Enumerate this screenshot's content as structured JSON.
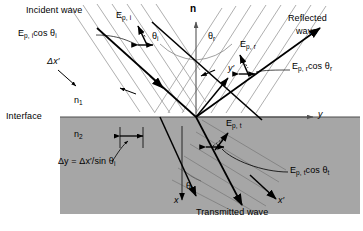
{
  "figure": {
    "colors": {
      "background": "#ffffff",
      "medium2_fill": "#a6a6a6",
      "ray": "#000000",
      "wavefront": "#8c8c8c",
      "axis": "#595959"
    }
  },
  "labels": {
    "incident_wave": "Incident wave",
    "reflected_wave_line1": "Reflected",
    "reflected_wave_line2": "wave",
    "transmitted_wave": "Transmitted wave",
    "interface": "Interface",
    "normal": "n",
    "n1": "n",
    "n1_sub": "1",
    "n2": "n",
    "n2_sub": "2",
    "theta_i": "θ",
    "theta_i_sub": "i",
    "theta_r": "θ",
    "theta_r_sub": "r",
    "theta_t": "θ",
    "theta_t_sub": "t",
    "E_sym": "E",
    "Epi_sub": "p, i",
    "Epr_sub": "p, r",
    "Ept_sub": "p, t",
    "cos_theta_i": "cos θ",
    "cos_theta_r": "cos θ",
    "cos_theta_t": "cos θ",
    "delta_x_prime": "Δx′",
    "delta_y_equation_lhs": "Δy",
    "delta_y_equation_rhs": "= Δx′/sin θ",
    "delta_y_equation_sub": "i",
    "axis_y": "y",
    "axis_y_prime": "y′",
    "axis_x": "x",
    "axis_x_prime": "x′"
  },
  "annotations": {
    "Epi_vector": "E_p,i",
    "Epi_projection": "E_p,i cos θ_i",
    "Epr_vector": "E_p,r",
    "Epr_projection": "E_p,r cos θ_r",
    "Ept_vector": "E_p,t",
    "Ept_projection": "E_p,t cos θ_t"
  }
}
